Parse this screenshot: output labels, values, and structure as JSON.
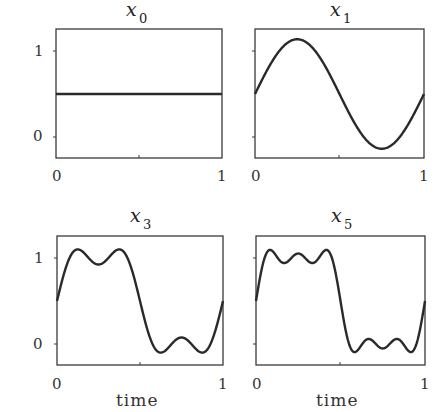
{
  "chart_data": [
    {
      "type": "line",
      "title": "x_0",
      "title_main": "x",
      "title_sub": "0",
      "xlabel": "",
      "ylabel": "",
      "xlim": [
        0,
        1
      ],
      "ylim": [
        -0.25,
        1.25
      ],
      "xticks": [
        "0",
        "1"
      ],
      "yticks": [
        "0",
        "1"
      ],
      "description": "Fourier partial sum of square wave with 0 harmonics (constant)",
      "harmonics": 0,
      "x": [
        0,
        0.25,
        0.5,
        0.75,
        1
      ],
      "values": [
        0.5,
        0.5,
        0.5,
        0.5,
        0.5
      ]
    },
    {
      "type": "line",
      "title": "x_1",
      "title_main": "x",
      "title_sub": "1",
      "xlabel": "",
      "ylabel": "",
      "xlim": [
        0,
        1
      ],
      "ylim": [
        -0.25,
        1.25
      ],
      "xticks": [
        "0",
        "1"
      ],
      "yticks": [],
      "description": "Fourier partial sum with first harmonic: 0.5 + (2/pi) sin(2 pi t)",
      "harmonics": 1,
      "x": [
        0,
        0.125,
        0.25,
        0.375,
        0.5,
        0.625,
        0.75,
        0.875,
        1
      ],
      "values": [
        0.5,
        0.95,
        1.14,
        0.95,
        0.5,
        0.05,
        -0.14,
        0.05,
        0.5
      ]
    },
    {
      "type": "line",
      "title": "x_3",
      "title_main": "x",
      "title_sub": "3",
      "xlabel": "time",
      "ylabel": "",
      "xlim": [
        0,
        1
      ],
      "ylim": [
        -0.25,
        1.25
      ],
      "xticks": [
        "0",
        "1"
      ],
      "yticks": [
        "0",
        "1"
      ],
      "description": "Fourier partial sum with harmonics 1 and 3",
      "harmonics": 3,
      "x": [
        0,
        0.0833,
        0.25,
        0.4167,
        0.5,
        0.5833,
        0.75,
        0.9167,
        1
      ],
      "values": [
        0.5,
        1.1,
        0.92,
        1.1,
        0.5,
        -0.1,
        0.08,
        -0.1,
        0.5
      ]
    },
    {
      "type": "line",
      "title": "x_5",
      "title_main": "x",
      "title_sub": "5",
      "xlabel": "time",
      "ylabel": "",
      "xlim": [
        0,
        1
      ],
      "ylim": [
        -0.25,
        1.25
      ],
      "xticks": [
        "0",
        "1"
      ],
      "yticks": [],
      "description": "Fourier partial sum with harmonics 1, 3 and 5",
      "harmonics": 5,
      "x": [
        0,
        0.05,
        0.15,
        0.25,
        0.35,
        0.45,
        0.5,
        0.55,
        0.65,
        0.75,
        0.85,
        0.95,
        1
      ],
      "values": [
        0.5,
        1.1,
        0.93,
        1.05,
        0.93,
        1.1,
        0.5,
        -0.1,
        0.07,
        -0.05,
        0.07,
        -0.1,
        0.5
      ]
    }
  ],
  "panels": [
    {
      "title_main": "x",
      "title_sub": "0",
      "ytick_top": "1",
      "ytick_bottom": "0",
      "xtick_left": "0",
      "xtick_right": "1",
      "xlabel": ""
    },
    {
      "title_main": "x",
      "title_sub": "1",
      "ytick_top": "",
      "ytick_bottom": "",
      "xtick_left": "0",
      "xtick_right": "1",
      "xlabel": ""
    },
    {
      "title_main": "x",
      "title_sub": "3",
      "ytick_top": "1",
      "ytick_bottom": "0",
      "xtick_left": "0",
      "xtick_right": "1",
      "xlabel": "time"
    },
    {
      "title_main": "x",
      "title_sub": "5",
      "ytick_top": "",
      "ytick_bottom": "",
      "xtick_left": "0",
      "xtick_right": "1",
      "xlabel": "time"
    }
  ],
  "colors": {
    "line": "#2a2a2a",
    "frame": "#3a3a3a",
    "background": "#ffffff"
  }
}
